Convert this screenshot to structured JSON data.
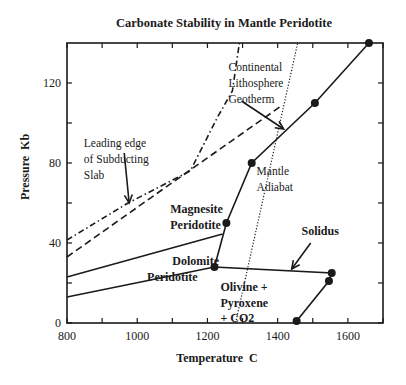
{
  "chart_data": {
    "type": "line",
    "title": "Carbonate Stability in Mantle Peridotite",
    "xlabel": "Temperature  C",
    "ylabel": "Pressure  Kb",
    "xlim": [
      800,
      1700
    ],
    "ylim": [
      0,
      140
    ],
    "x_ticks": [
      800,
      1000,
      1200,
      1400,
      1600
    ],
    "x_minor_ticks": [
      900,
      1100,
      1300,
      1500,
      1700
    ],
    "y_ticks": [
      0,
      40,
      80,
      120
    ],
    "y_minor_ticks": [
      20,
      60,
      100
    ],
    "grid": false,
    "legend": null,
    "series": [
      {
        "name": "Solidus (carbonated peridotite)",
        "style": "solid-with-markers",
        "points": [
          [
            1454,
            1
          ],
          [
            1546,
            21
          ],
          [
            1554,
            25
          ],
          [
            1220,
            28
          ],
          [
            1254,
            50
          ],
          [
            1326,
            80
          ],
          [
            1506,
            110
          ],
          [
            1660,
            140
          ]
        ],
        "markers": [
          [
            1454,
            1
          ],
          [
            1546,
            21
          ],
          [
            1554,
            25
          ],
          [
            1220,
            28
          ],
          [
            1254,
            50
          ],
          [
            1326,
            80
          ],
          [
            1506,
            110
          ],
          [
            1660,
            140
          ]
        ]
      },
      {
        "name": "Dolomite-out boundary (lower)",
        "style": "solid",
        "points": [
          [
            800,
            13
          ],
          [
            1220,
            28
          ]
        ]
      },
      {
        "name": "Dolomite/Magnesite boundary",
        "style": "solid",
        "points": [
          [
            800,
            23
          ],
          [
            1243,
            44.5
          ]
        ]
      },
      {
        "name": "Continental Lithosphere Geotherm",
        "style": "dashed",
        "points": [
          [
            800,
            33
          ],
          [
            1066,
            66
          ],
          [
            1414,
            109
          ]
        ]
      },
      {
        "name": "Leading edge of Subducting Slab",
        "style": "dash-dot",
        "points": [
          [
            800,
            41.5
          ],
          [
            974,
            60
          ],
          [
            1151,
            76
          ],
          [
            1229,
            103
          ],
          [
            1271,
            116
          ],
          [
            1291,
            140
          ]
        ]
      },
      {
        "name": "Mantle Adiabat",
        "style": "dotted",
        "points": [
          [
            1280,
            0
          ],
          [
            1457,
            140
          ]
        ]
      }
    ],
    "annotations": [
      {
        "text": "Continental",
        "x": 1260,
        "y": 126,
        "bold": false
      },
      {
        "text": "Lithosphere",
        "x": 1260,
        "y": 118,
        "bold": false
      },
      {
        "text": "Geotherm",
        "x": 1260,
        "y": 110,
        "bold": false
      },
      {
        "text": "Leading edge",
        "x": 848,
        "y": 88,
        "bold": false
      },
      {
        "text": "of Subducting",
        "x": 848,
        "y": 80,
        "bold": false
      },
      {
        "text": "Slab",
        "x": 848,
        "y": 72,
        "bold": false
      },
      {
        "text": "Magnesite",
        "x": 1094,
        "y": 55,
        "bold": true
      },
      {
        "text": "Peridotite",
        "x": 1094,
        "y": 47,
        "bold": true
      },
      {
        "text": "Mantle",
        "x": 1340,
        "y": 74,
        "bold": false
      },
      {
        "text": "Adiabat",
        "x": 1340,
        "y": 66,
        "bold": false
      },
      {
        "text": "Solidus",
        "x": 1468,
        "y": 44,
        "bold": true
      },
      {
        "text": "Dolomite",
        "x": 1100,
        "y": 29,
        "bold": true
      },
      {
        "text": "Peridotite",
        "x": 1028,
        "y": 21,
        "bold": true
      },
      {
        "text": "Olivine  +",
        "x": 1237,
        "y": 16,
        "bold": true
      },
      {
        "text": "Pyroxene",
        "x": 1237,
        "y": 8,
        "bold": true
      },
      {
        "text": "+ CO2",
        "x": 1237,
        "y": 0.5,
        "bold": true
      }
    ],
    "arrows": [
      {
        "name": "geotherm-arrow",
        "from": [
          1297,
          111
        ],
        "to": [
          1417,
          97
        ]
      },
      {
        "name": "slab-arrow",
        "from": [
          963,
          85
        ],
        "to": [
          977,
          60
        ]
      },
      {
        "name": "solidus-arrow",
        "from": [
          1494,
          40
        ],
        "to": [
          1440,
          27
        ]
      }
    ]
  }
}
